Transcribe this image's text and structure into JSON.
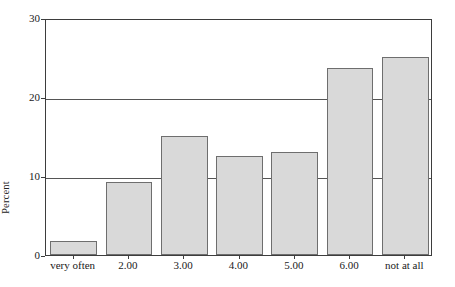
{
  "chart_data": {
    "type": "bar",
    "title": "",
    "xlabel": "",
    "ylabel": "Percent",
    "categories": [
      "very often",
      "2.00",
      "3.00",
      "4.00",
      "5.00",
      "6.00",
      "not at all"
    ],
    "values": [
      1.8,
      9.2,
      15.1,
      12.5,
      13.0,
      23.7,
      25.1
    ],
    "ylim": [
      0,
      30
    ],
    "y_ticks": [
      0,
      10,
      20,
      30
    ],
    "y_tick_labels": [
      "0",
      "10",
      "20",
      "30"
    ],
    "grid": "horizontal",
    "legend": "none",
    "bar_fill_color": "#d9d9d9",
    "bar_border_color": "#6e6e6e",
    "axis_color": "#3d3d3d",
    "gridline_color": "#555555",
    "background_color": "#ffffff"
  },
  "axis": {
    "y_title": "Percent"
  }
}
